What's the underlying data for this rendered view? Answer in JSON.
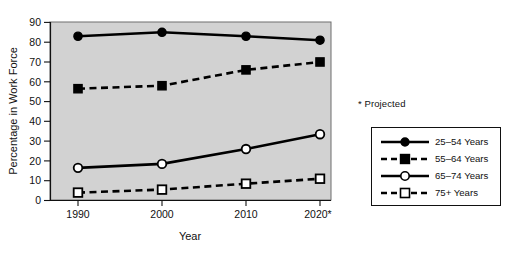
{
  "chart_data": {
    "type": "line",
    "title": "",
    "xlabel": "Year",
    "ylabel": "Percentage in Work Force",
    "categories": [
      "1990",
      "2000",
      "2010",
      "2020*"
    ],
    "x_tick_labels": [
      "1990",
      "2000",
      "2010",
      "2020*"
    ],
    "y_tick_labels": [
      "0",
      "10",
      "20",
      "30",
      "40",
      "50",
      "60",
      "70",
      "80",
      "90"
    ],
    "y_ticks": [
      0,
      10,
      20,
      30,
      40,
      50,
      60,
      70,
      80,
      90
    ],
    "ylim": [
      0,
      90
    ],
    "grid": false,
    "legend_position": "right",
    "plot_background": "#d2d2d2",
    "series": [
      {
        "name": "25–54 Years",
        "values": [
          83,
          85,
          83,
          81
        ],
        "line_style": "solid",
        "marker": "filled-circle",
        "color": "#000000"
      },
      {
        "name": "55–64 Years",
        "values": [
          56.5,
          58,
          66,
          70
        ],
        "line_style": "dashed",
        "marker": "filled-square",
        "color": "#000000"
      },
      {
        "name": "65–74 Years",
        "values": [
          16.5,
          18.5,
          26,
          33.5
        ],
        "line_style": "solid",
        "marker": "open-circle",
        "color": "#000000"
      },
      {
        "name": "75+ Years",
        "values": [
          4,
          5.5,
          8.5,
          11
        ],
        "line_style": "dashed",
        "marker": "open-square",
        "color": "#000000"
      }
    ],
    "annotations": [
      {
        "text": "* Projected"
      }
    ]
  },
  "axes": {
    "y_title": "Percentage in Work Force",
    "x_title": "Year",
    "y_labels": [
      "90",
      "80",
      "70",
      "60",
      "50",
      "40",
      "30",
      "20",
      "10",
      "0"
    ],
    "x_labels": [
      "1990",
      "2000",
      "2010",
      "2020*"
    ]
  },
  "notes": {
    "projected": "* Projected"
  },
  "legend": {
    "items": [
      {
        "label": "25–54 Years"
      },
      {
        "label": "55–64 Years"
      },
      {
        "label": "65–74 Years"
      },
      {
        "label": "75+ Years"
      }
    ]
  }
}
